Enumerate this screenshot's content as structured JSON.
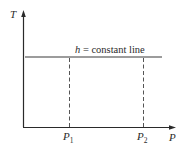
{
  "diagram": {
    "type": "T-P diagram",
    "y_axis": {
      "label": "T"
    },
    "x_axis": {
      "label": "P"
    },
    "curve": {
      "label_symbol": "h",
      "label_text": " = constant line"
    },
    "markers": [
      {
        "symbol": "P",
        "subscript": "1"
      },
      {
        "symbol": "P",
        "subscript": "2"
      }
    ],
    "colors": {
      "axis": "#2a2a2a",
      "line": "#3a3a3a",
      "dashed": "#555555",
      "background": "#ffffff"
    }
  }
}
